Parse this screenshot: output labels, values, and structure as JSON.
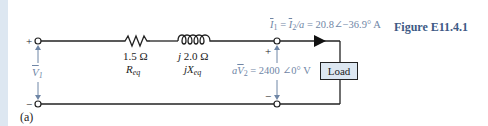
{
  "figure": {
    "title": "Figure E11.4.1",
    "part_label": "(a)"
  },
  "colors": {
    "wire": "#222222",
    "annotation_blue": "#6f86a6",
    "title_blue": "#3d5a85",
    "load_fill": "#dde7f1",
    "left_strip": "#dde7f1"
  },
  "input_port": {
    "plus": "+",
    "minus": "−",
    "voltage_symbol": "V",
    "voltage_subscript": "1"
  },
  "resistor": {
    "value": "1.5 Ω",
    "name": "R",
    "name_subscript": "eq"
  },
  "inductor": {
    "value": "j 2.0 Ω",
    "name": "jX",
    "name_subscript": "eq"
  },
  "current_annotation": {
    "text_I1": "I",
    "sub_1": "1",
    "eq1": " = ",
    "text_I2": "I",
    "sub_2": "2",
    "div": "/a",
    "eq2": " = 20.8∠−36.9° A"
  },
  "output_port": {
    "plus": "+",
    "minus": "−",
    "prefix": "a",
    "voltage_symbol": "V",
    "voltage_subscript": "2",
    "value": " = 2400 ∠0° V"
  },
  "load": {
    "label": "Load"
  }
}
